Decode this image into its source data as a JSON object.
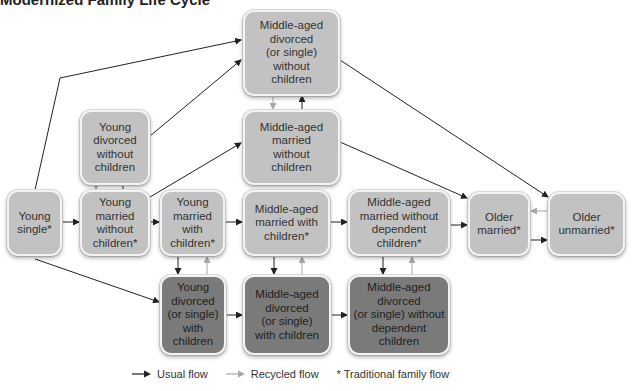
{
  "title": "Modernized Family Life Cycle",
  "nodes": {
    "ma_div_no_children": {
      "label": "Middle-aged divorced (or single) without children",
      "lines": [
        "Middle-aged",
        "divorced",
        "(or single)",
        "without",
        "children"
      ],
      "shade": "light"
    },
    "young_div_no_children": {
      "label": "Young divorced without children",
      "lines": [
        "Young",
        "divorced",
        "without",
        "children"
      ],
      "shade": "light"
    },
    "ma_married_no_children": {
      "label": "Middle-aged married without children",
      "lines": [
        "Middle-aged",
        "married",
        "without",
        "children"
      ],
      "shade": "light"
    },
    "young_single": {
      "label": "Young single*",
      "lines": [
        "Young",
        "single*"
      ],
      "shade": "light"
    },
    "young_married_no_children": {
      "label": "Young married without children*",
      "lines": [
        "Young",
        "married",
        "without",
        "children*"
      ],
      "shade": "light"
    },
    "young_married_children": {
      "label": "Young married with children*",
      "lines": [
        "Young",
        "married",
        "with",
        "children*"
      ],
      "shade": "light"
    },
    "ma_married_children": {
      "label": "Middle-aged married with children*",
      "lines": [
        "Middle-aged",
        "married with",
        "children*"
      ],
      "shade": "light"
    },
    "ma_married_no_dep": {
      "label": "Middle-aged married without dependent children*",
      "lines": [
        "Middle-aged",
        "married without",
        "dependent",
        "children*"
      ],
      "shade": "light"
    },
    "older_married": {
      "label": "Older married*",
      "lines": [
        "Older",
        "married*"
      ],
      "shade": "light"
    },
    "older_unmarried": {
      "label": "Older unmarried*",
      "lines": [
        "Older",
        "unmarried*"
      ],
      "shade": "light"
    },
    "young_div_children": {
      "label": "Young divorced (or single) with children",
      "lines": [
        "Young",
        "divorced",
        "(or single)",
        "with",
        "children"
      ],
      "shade": "dark"
    },
    "ma_div_children": {
      "label": "Middle-aged divorced (or single) with children",
      "lines": [
        "Middle-aged",
        "divorced",
        "(or single)",
        "with children"
      ],
      "shade": "dark"
    },
    "ma_div_no_dep": {
      "label": "Middle-aged divorced (or single) without dependent children",
      "lines": [
        "Middle-aged",
        "divorced",
        "(or single) without",
        "dependent",
        "children"
      ],
      "shade": "dark"
    }
  },
  "edges": [
    {
      "from": "young_single",
      "to": "young_married_no_children",
      "type": "usual"
    },
    {
      "from": "young_single",
      "to": "ma_div_no_children",
      "type": "usual"
    },
    {
      "from": "young_single",
      "to": "young_div_children",
      "type": "usual"
    },
    {
      "from": "young_married_no_children",
      "to": "young_div_no_children",
      "type": "usual"
    },
    {
      "from": "young_div_no_children",
      "to": "young_married_no_children",
      "type": "recycled"
    },
    {
      "from": "young_div_no_children",
      "to": "ma_div_no_children",
      "type": "usual"
    },
    {
      "from": "young_married_no_children",
      "to": "ma_married_no_children",
      "type": "usual"
    },
    {
      "from": "young_married_no_children",
      "to": "young_married_children",
      "type": "usual"
    },
    {
      "from": "ma_married_no_children",
      "to": "ma_div_no_children",
      "type": "usual"
    },
    {
      "from": "ma_div_no_children",
      "to": "ma_married_no_children",
      "type": "recycled"
    },
    {
      "from": "ma_married_no_children",
      "to": "older_married",
      "type": "usual"
    },
    {
      "from": "ma_div_no_children",
      "to": "older_unmarried",
      "type": "usual"
    },
    {
      "from": "young_married_children",
      "to": "ma_married_children",
      "type": "usual"
    },
    {
      "from": "ma_married_children",
      "to": "ma_married_no_dep",
      "type": "usual"
    },
    {
      "from": "ma_married_no_dep",
      "to": "older_married",
      "type": "usual"
    },
    {
      "from": "older_married",
      "to": "older_unmarried",
      "type": "usual"
    },
    {
      "from": "older_unmarried",
      "to": "older_married",
      "type": "recycled"
    },
    {
      "from": "young_married_children",
      "to": "young_div_children",
      "type": "usual"
    },
    {
      "from": "young_div_children",
      "to": "young_married_children",
      "type": "recycled"
    },
    {
      "from": "ma_married_children",
      "to": "ma_div_children",
      "type": "usual"
    },
    {
      "from": "ma_div_children",
      "to": "ma_married_children",
      "type": "recycled"
    },
    {
      "from": "ma_married_no_dep",
      "to": "ma_div_no_dep",
      "type": "usual"
    },
    {
      "from": "ma_div_no_dep",
      "to": "ma_married_no_dep",
      "type": "recycled"
    },
    {
      "from": "young_div_children",
      "to": "ma_div_children",
      "type": "usual"
    },
    {
      "from": "ma_div_children",
      "to": "ma_div_no_dep",
      "type": "usual"
    }
  ],
  "legend": {
    "usual": "Usual flow",
    "recycled": "Recycled flow",
    "traditional": "* Traditional family flow"
  },
  "colors": {
    "light_box": "#c2c2c2",
    "dark_box": "#7a7a7a",
    "usual_arrow": "#222222",
    "recycled_arrow": "#a8a8a8"
  }
}
